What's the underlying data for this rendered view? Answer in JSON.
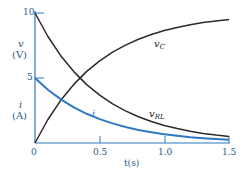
{
  "chart_data": {
    "type": "line",
    "title": "",
    "xlabel": "t(s)",
    "ylabel_top": "v",
    "ylabel_top_unit": "(V)",
    "ylabel_bottom": "i",
    "ylabel_bottom_unit": "(A)",
    "xlim": [
      0,
      1.5
    ],
    "ylim": [
      0,
      10
    ],
    "grid": false,
    "x_ticks": [
      "0",
      "0.5",
      "1.0",
      "1.5"
    ],
    "y_ticks": [
      "5",
      "10"
    ],
    "x": [
      0,
      0.1,
      0.2,
      0.3,
      0.4,
      0.5,
      0.6,
      0.7,
      0.8,
      0.9,
      1.0,
      1.1,
      1.2,
      1.3,
      1.4,
      1.5
    ],
    "series": [
      {
        "name": "v_C",
        "color": "#2b2b2b",
        "values": [
          0,
          1.81,
          3.3,
          4.51,
          5.51,
          6.32,
          6.99,
          7.53,
          7.98,
          8.35,
          8.65,
          8.89,
          9.09,
          9.26,
          9.39,
          9.5
        ]
      },
      {
        "name": "v_RL",
        "color": "#2b2b2b",
        "values": [
          10,
          8.19,
          6.7,
          5.49,
          4.49,
          3.68,
          3.01,
          2.47,
          2.02,
          1.65,
          1.35,
          1.11,
          0.91,
          0.74,
          0.61,
          0.5
        ]
      },
      {
        "name": "i",
        "color": "#2f78c2",
        "values": [
          5,
          4.09,
          3.35,
          2.74,
          2.25,
          1.84,
          1.51,
          1.23,
          1.01,
          0.83,
          0.68,
          0.55,
          0.45,
          0.37,
          0.3,
          0.25
        ]
      }
    ],
    "annotations": [
      "v_C",
      "v_RL",
      "i"
    ]
  },
  "labels": {
    "v": "v",
    "v_unit": "(V)",
    "i": "i",
    "i_unit": "(A)",
    "xlabel": "t(s)",
    "tick_0": "0",
    "tick_05": "0.5",
    "tick_10": "1.0",
    "tick_15": "1.5",
    "ytick_5": "5",
    "ytick_10": "10",
    "vc_main": "v",
    "vc_sub": "C",
    "vrl_main": "v",
    "vrl_sub": "RL",
    "i_curve": "i"
  }
}
